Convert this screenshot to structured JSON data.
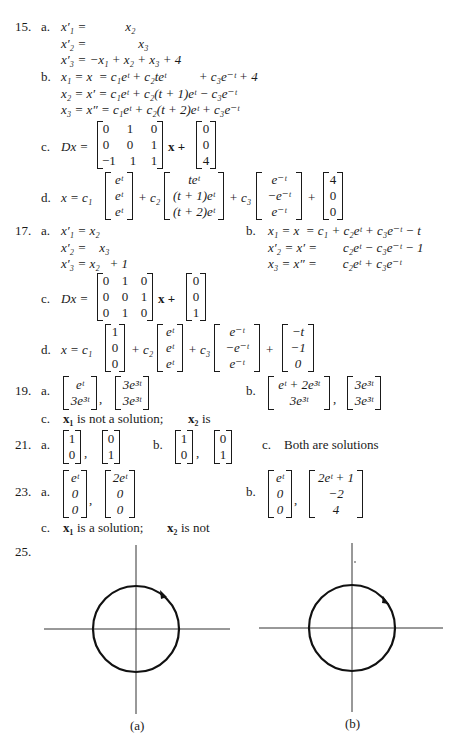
{
  "p15": {
    "num": "15.",
    "a_label": "a.",
    "a_lines": [
      "x′₁ =            x₂",
      "x′₂ =                x₃",
      "x′₃ = −x₁ + x₂ + x₃ + 4"
    ],
    "b_label": "b.",
    "b_lines": [
      "x₁ = x  = c₁eᵗ + c₂teᵗ          + c₃e⁻ᵗ + 4",
      "x₂ = x′ = c₁eᵗ + c₂(t + 1)eᵗ − c₃e⁻ᵗ",
      "x₃ = x″ = c₁eᵗ + c₂(t + 2)eᵗ + c₃e⁻ᵗ"
    ],
    "c_label": "c.",
    "c_lhs": "Dx =",
    "c_matrix": [
      [
        "0",
        "1",
        "0"
      ],
      [
        "0",
        "0",
        "1"
      ],
      [
        "−1",
        "1",
        "1"
      ]
    ],
    "c_x": "x +",
    "c_vector": [
      "0",
      "0",
      "4"
    ],
    "d_label": "d.",
    "d_lhs": "x = c₁",
    "d_v1": [
      "eᵗ",
      "eᵗ",
      "eᵗ"
    ],
    "d_c2": "+ c₂",
    "d_v2": [
      "teᵗ",
      "(t + 1)eᵗ",
      "(t + 2)eᵗ"
    ],
    "d_c3": "+ c₃",
    "d_v3": [
      "e⁻ᵗ",
      "−e⁻ᵗ",
      "e⁻ᵗ"
    ],
    "d_plus": "+",
    "d_v4": [
      "4",
      "0",
      "0"
    ]
  },
  "p17": {
    "num": "17.",
    "a_label": "a.",
    "a_lines": [
      "x′₁ = x₂",
      "x′₂ =    x₃",
      "x′₃ = x₂   + 1"
    ],
    "b_label": "b.",
    "b_lines": [
      "x₁ = x  = c₁ + c₂eᵗ + c₃e⁻ᵗ − t",
      "x′₂ = x′ =        c₂eᵗ − c₃e⁻ᵗ − 1",
      "x₃ = x″ =        c₂eᵗ + c₃e⁻ᵗ"
    ],
    "c_label": "c.",
    "c_lhs": "Dx =",
    "c_matrix": [
      [
        "0",
        "1",
        "0"
      ],
      [
        "0",
        "0",
        "1"
      ],
      [
        "0",
        "1",
        "0"
      ]
    ],
    "c_x": "x +",
    "c_vector": [
      "0",
      "0",
      "1"
    ],
    "d_label": "d.",
    "d_lhs": "x = c₁",
    "d_v1": [
      "1",
      "0",
      "0"
    ],
    "d_c2": "+ c₂",
    "d_v2": [
      "eᵗ",
      "eᵗ",
      "eᵗ"
    ],
    "d_c3": "+ c₃",
    "d_v3": [
      "e⁻ᵗ",
      "−e⁻ᵗ",
      "e⁻ᵗ"
    ],
    "d_plus": "+",
    "d_v4": [
      "−t",
      "−1",
      "0"
    ]
  },
  "p19": {
    "num": "19.",
    "a_label": "a.",
    "a_v1": [
      "eᵗ",
      "3e³ᵗ"
    ],
    "a_v2": [
      "3e³ᵗ",
      "3e³ᵗ"
    ],
    "b_label": "b.",
    "b_v1": [
      "eᵗ + 2e³ᵗ",
      "3e³ᵗ"
    ],
    "b_v2": [
      "3e³ᵗ",
      "3e³ᵗ"
    ],
    "comma": ",",
    "c_label": "c.",
    "c_x1": "x₁",
    "c_text1": "is not a solution;",
    "c_x2": "x₂",
    "c_text2": "is"
  },
  "p21": {
    "num": "21.",
    "a_label": "a.",
    "a_v1": [
      "1",
      "0"
    ],
    "a_v2": [
      "0",
      "1"
    ],
    "b_label": "b.",
    "b_v1": [
      "1",
      "0"
    ],
    "b_v2": [
      "0",
      "1"
    ],
    "comma": ",",
    "c_label": "c.",
    "c_text": "Both are solutions"
  },
  "p23": {
    "num": "23.",
    "a_label": "a.",
    "a_v1": [
      "eᵗ",
      "0",
      "0"
    ],
    "a_v2": [
      "2eᵗ",
      "0",
      "0"
    ],
    "b_label": "b.",
    "b_v1": [
      "eᵗ",
      "0",
      "0"
    ],
    "b_v2": [
      "2eᵗ + 1",
      "−2",
      "4"
    ],
    "comma": ",",
    "c_label": "c.",
    "c_x1": "x₁",
    "c_text1": "is a solution;",
    "c_x2": "x₂",
    "c_text2": "is not"
  },
  "p25": {
    "num": "25.",
    "fig_a_caption": "(a)",
    "fig_b_caption": "(b)",
    "fig_a_direction": "clockwise",
    "fig_b_direction": "counterclockwise"
  }
}
